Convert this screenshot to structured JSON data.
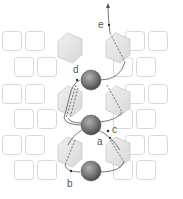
{
  "diagram": {
    "labels": {
      "a": "a",
      "b": "b",
      "c": "c",
      "d": "d",
      "e": "e"
    },
    "colors": {
      "square_stroke": "#d8d8d8",
      "hexagon_fill": "#e6e6e6",
      "hexagon_stroke": "#c8c8c8",
      "sphere_dark": "#555555",
      "sphere_light": "#a8a8a8",
      "path_line": "#555555"
    },
    "elements": {
      "spheres": 3,
      "hexagons": 6,
      "squares": 24
    }
  }
}
